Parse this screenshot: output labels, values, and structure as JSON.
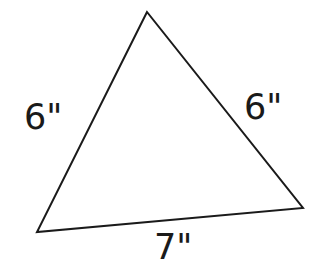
{
  "diagram": {
    "type": "triangle",
    "stroke_color": "#1a1a1a",
    "vertices": {
      "top": [
        147,
        12
      ],
      "bottom_left": [
        37,
        232
      ],
      "bottom_right": [
        303,
        208
      ]
    },
    "sides": {
      "left": {
        "label": "6\""
      },
      "right": {
        "label": "6\""
      },
      "bottom": {
        "label": "7\""
      }
    }
  }
}
